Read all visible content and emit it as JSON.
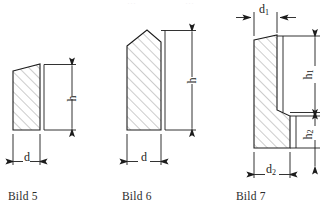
{
  "page": {
    "background_color": "#ffffff",
    "line_color": "#1c1c1c",
    "hatch_color": "#8c8c8c",
    "caption_color": "#2b2b2b",
    "width": 331,
    "height": 213
  },
  "figures": [
    {
      "id": "bild-5",
      "caption": "Bild 5",
      "shape": "trapezoid-slanted-top",
      "dimensions": [
        {
          "name": "h",
          "label": "h",
          "orientation": "vertical",
          "side": "right"
        },
        {
          "name": "d",
          "label": "d",
          "orientation": "horizontal",
          "side": "bottom"
        }
      ]
    },
    {
      "id": "bild-6",
      "caption": "Bild 6",
      "shape": "rectangle-pointed-top",
      "dimensions": [
        {
          "name": "h",
          "label": "h",
          "orientation": "vertical",
          "side": "right"
        },
        {
          "name": "d",
          "label": "d",
          "orientation": "horizontal",
          "side": "bottom"
        }
      ]
    },
    {
      "id": "bild-7",
      "caption": "Bild 7",
      "shape": "stepped-L-profile",
      "dimensions": [
        {
          "name": "d1",
          "label": "d",
          "subscript": "1",
          "orientation": "horizontal",
          "side": "top"
        },
        {
          "name": "h1",
          "label": "h",
          "subscript": "1",
          "orientation": "vertical",
          "side": "right"
        },
        {
          "name": "h2",
          "label": "h",
          "subscript": "2",
          "orientation": "vertical",
          "side": "right"
        },
        {
          "name": "d2",
          "label": "d",
          "subscript": "2",
          "orientation": "horizontal",
          "side": "bottom"
        }
      ]
    }
  ],
  "labels": {
    "h_fig5": "h",
    "d_fig5": "d",
    "h_fig6": "h",
    "d_fig6": "d",
    "d1_base": "d",
    "d1_sub": "1",
    "h1_base": "h",
    "h1_sub": "1",
    "h2_base": "h",
    "h2_sub": "2",
    "d2_base": "d",
    "d2_sub": "2"
  },
  "artifacts": {
    "top_remnant_left": "···",
    "top_remnant_right": "···"
  }
}
